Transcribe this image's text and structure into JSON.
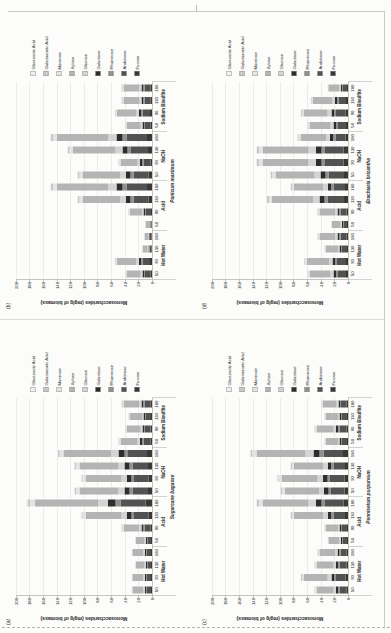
{
  "chart_data": {
    "type": "bar",
    "stacked": true,
    "layout_note": "Four stacked-bar panels printed rotated 90 degrees counterclockwise on a portrait page",
    "ylabel": "Monosaccharides (mg/g of biomass)",
    "ylim": [
      0,
      200
    ],
    "ytick_step": 20,
    "ytick_labels": [
      "0",
      "20",
      "40",
      "60",
      "80",
      "100",
      "120",
      "140",
      "160",
      "180",
      "200"
    ],
    "grid": true,
    "legend_position": "right",
    "groups": [
      "Hot Water",
      "Acid",
      "NaOH",
      "Sodium Bisulfite"
    ],
    "bar_labels": [
      "50",
      "90",
      "130",
      "180"
    ],
    "legend": [
      "Glucuronic Acid",
      "Galacturonic Acid",
      "Mannose",
      "Xylose",
      "Glucose",
      "Galactose",
      "Rhamnose",
      "Arabinose",
      "Fucose"
    ],
    "series_style": [
      {
        "name": "Fucose",
        "color": "#383838",
        "fraction": 0.05
      },
      {
        "name": "Arabinose",
        "color": "#525252",
        "fraction": 0.2
      },
      {
        "name": "Rhamnose",
        "color": "#909090",
        "fraction": 0.04
      },
      {
        "name": "Galactose",
        "color": "#2d2d2d",
        "fraction": 0.06
      },
      {
        "name": "Glucose",
        "color": "#d4d4d4",
        "fraction": 0.08
      },
      {
        "name": "Xylose",
        "color": "#b4b4b4",
        "fraction": 0.5
      },
      {
        "name": "Mannose",
        "color": "#e4e4e4",
        "fraction": 0.04
      },
      {
        "name": "Galacturonic Acid",
        "color": "#c8c8c8",
        "fraction": 0.02
      },
      {
        "name": "Glucuronic Acid",
        "color": "#efefef",
        "fraction": 0.01
      }
    ],
    "panels": [
      {
        "panel_label": "(b)",
        "species": "Panicum maximum",
        "position": "top-left",
        "totals_by_group": {
          "Hot Water": [
            40,
            55,
            15,
            12
          ],
          "Acid": [
            10,
            35,
            110,
            150
          ],
          "NaOH": [
            110,
            50,
            125,
            150
          ],
          "Sodium Bisulfite": [
            40,
            55,
            45,
            45
          ]
        }
      },
      {
        "panel_label": "(d)",
        "species": "Brachiaria brizantha",
        "position": "top-right",
        "totals_by_group": {
          "Hot Water": [
            60,
            65,
            35,
            45
          ],
          "Acid": [
            25,
            45,
            120,
            85
          ],
          "NaOH": [
            115,
            135,
            135,
            75
          ],
          "Sodium Bisulfite": [
            60,
            70,
            55,
            30
          ]
        }
      },
      {
        "panel_label": "(a)",
        "species": "Sugarcane bagasse",
        "position": "bottom-left",
        "totals_by_group": {
          "Hot Water": [
            30,
            30,
            25,
            30
          ],
          "Acid": [
            25,
            45,
            105,
            185
          ],
          "NaOH": [
            115,
            105,
            115,
            140
          ],
          "Sodium Bisulfite": [
            50,
            40,
            35,
            45
          ]
        }
      },
      {
        "panel_label": "(c)",
        "species": "Pennisetum purpureum",
        "position": "bottom-right",
        "totals_by_group": {
          "Hot Water": [
            50,
            70,
            50,
            45
          ],
          "Acid": [
            30,
            35,
            85,
            135
          ],
          "NaOH": [
            100,
            105,
            85,
            145
          ],
          "Sodium Bisulfite": [
            35,
            50,
            35,
            40
          ]
        }
      }
    ]
  }
}
